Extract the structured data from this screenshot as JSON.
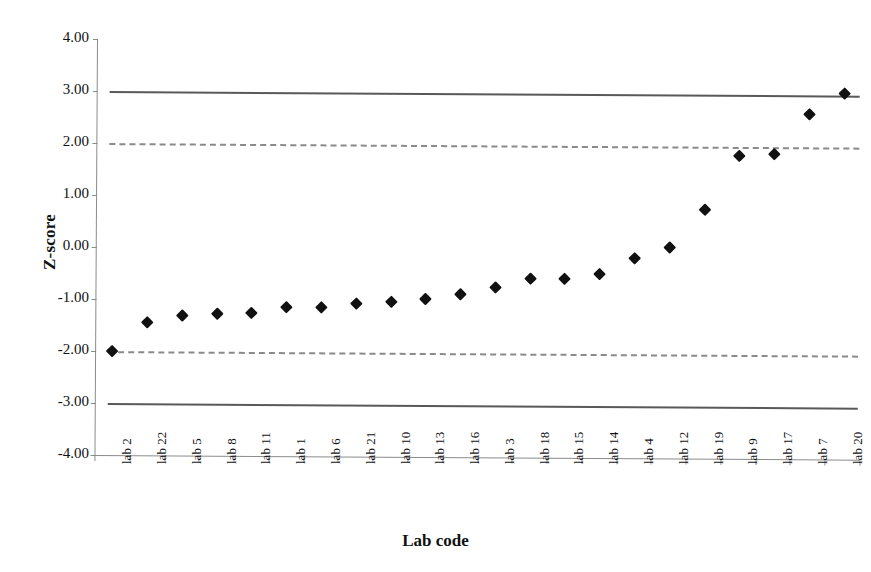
{
  "chart_data": {
    "type": "scatter",
    "title": "",
    "xlabel": "Lab code",
    "ylabel": "Z-score",
    "categories": [
      "lab 2",
      "lab 22",
      "lab 5",
      "lab 8",
      "lab 11",
      "lab 1",
      "lab 6",
      "lab 21",
      "lab 10",
      "lab 13",
      "lab 16",
      "lab 3",
      "lab 18",
      "lab 15",
      "lab 14",
      "lab 4",
      "lab 12",
      "lab 19",
      "lab 9",
      "lab 17",
      "lab 7",
      "lab 20"
    ],
    "values": [
      -2.0,
      -1.44,
      -1.3,
      -1.26,
      -1.25,
      -1.14,
      -1.13,
      -1.06,
      -1.01,
      -0.97,
      -0.86,
      -0.74,
      -0.56,
      -0.55,
      -0.46,
      -0.16,
      0.06,
      0.79,
      1.82,
      1.87,
      2.63,
      3.04
    ],
    "series": [
      {
        "name": "Z-score",
        "marker": "diamond",
        "color": "#111111",
        "values": [
          -2.0,
          -1.44,
          -1.3,
          -1.26,
          -1.25,
          -1.14,
          -1.13,
          -1.06,
          -1.01,
          -0.97,
          -0.86,
          -0.74,
          -0.56,
          -0.55,
          -0.46,
          -0.16,
          0.06,
          0.79,
          1.82,
          1.87,
          2.63,
          3.04
        ]
      }
    ],
    "ylim": [
      -4.0,
      4.0
    ],
    "yticks": [
      4.0,
      3.0,
      2.0,
      1.0,
      0.0,
      -1.0,
      -2.0,
      -3.0,
      -4.0
    ],
    "ytick_labels": [
      "4.00",
      "3.00",
      "2.00",
      "1.00",
      "0.00",
      "-1.00",
      "-2.00",
      "-3.00",
      "-4.00"
    ],
    "grid": false,
    "legend": "none",
    "reference_lines": [
      {
        "name": "action-limit-upper",
        "value": 3.0,
        "style": "solid",
        "color": "#595959"
      },
      {
        "name": "warning-limit-upper",
        "value": 2.0,
        "style": "dashed",
        "color": "#8a8a8a"
      },
      {
        "name": "warning-limit-lower",
        "value": -2.0,
        "style": "dashed",
        "color": "#8a8a8a"
      },
      {
        "name": "action-limit-lower",
        "value": -3.0,
        "style": "solid",
        "color": "#595959"
      }
    ]
  }
}
